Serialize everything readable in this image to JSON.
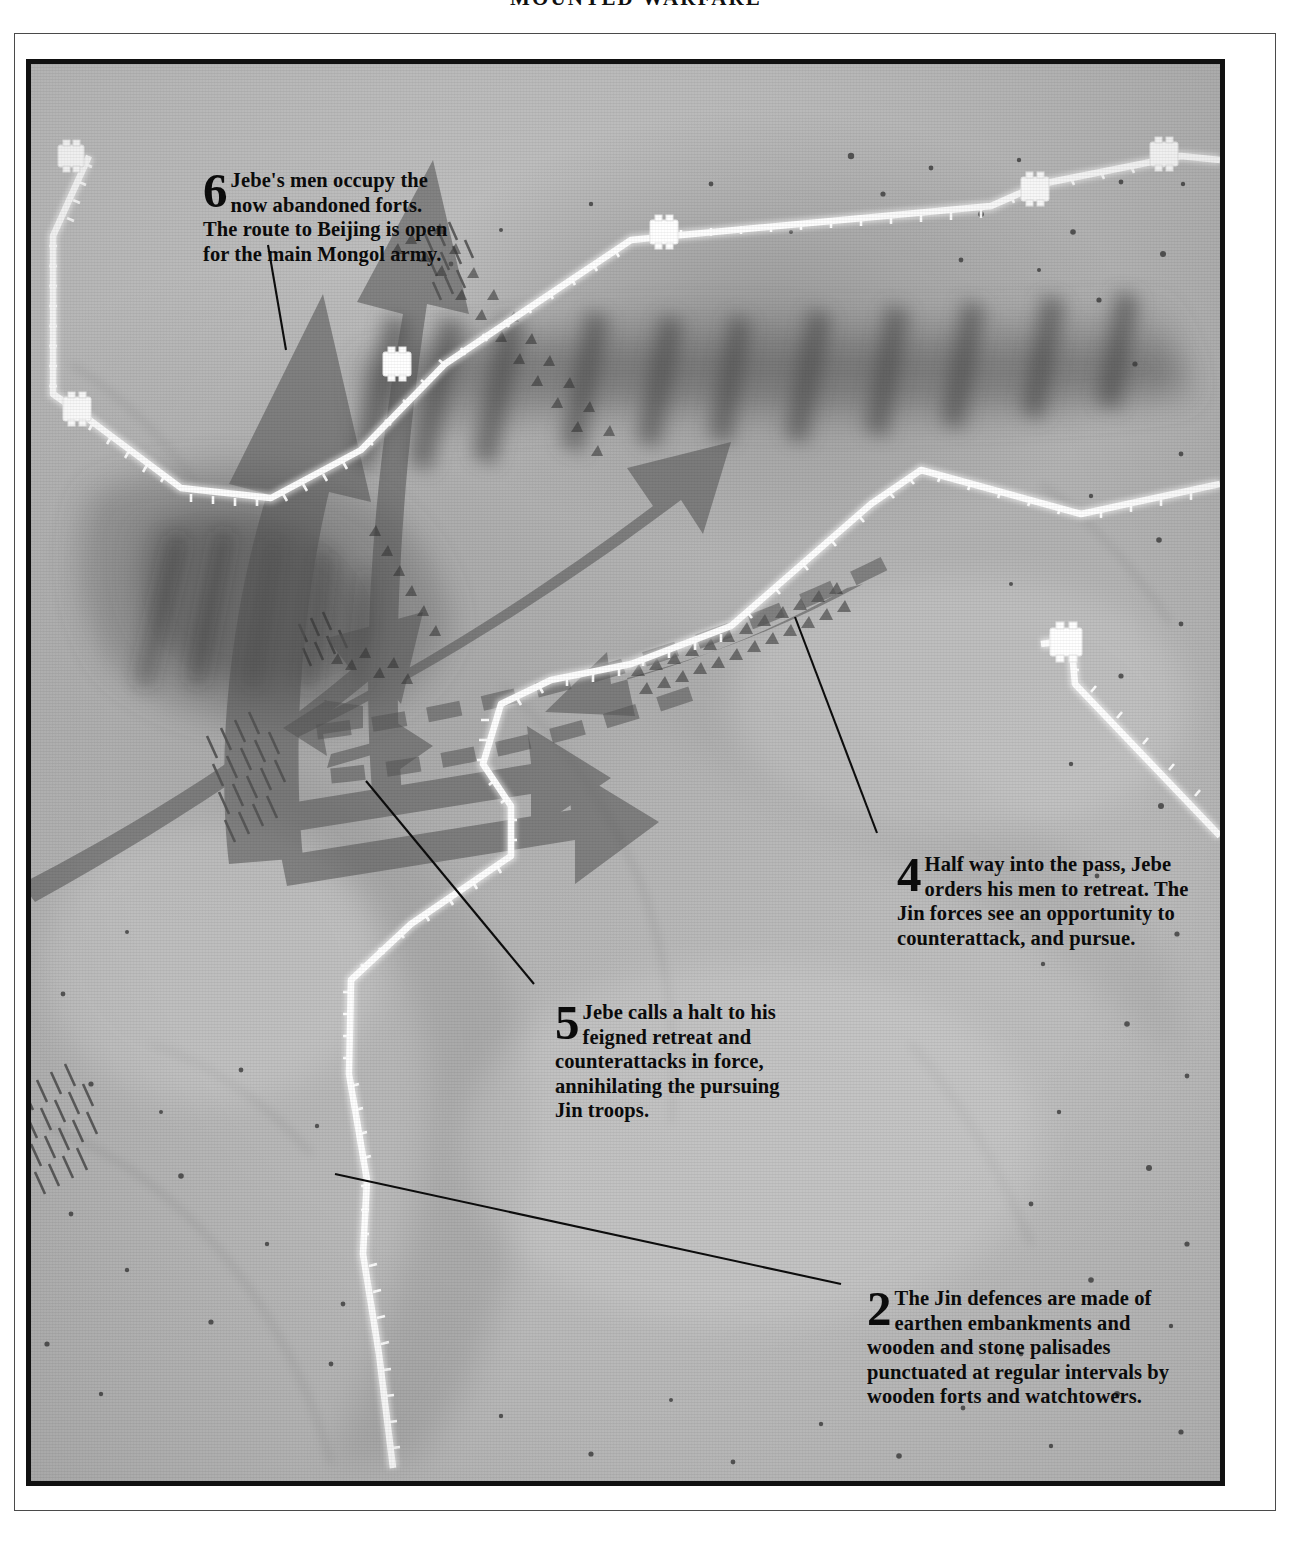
{
  "page": {
    "running_head": "MOUNTED WARFARE"
  },
  "map": {
    "title_visible": false,
    "base_color": "#b4b4b4",
    "frame_color": "#111111",
    "arrow_color": "#5f5f5f",
    "wall_color": "#ffffff",
    "callouts": [
      {
        "id": "callout-6",
        "number": "6",
        "text": "Jebe's men occupy the now abandoned forts. The route to Beijing is open for the main Mongol army.",
        "leader_from": [
          263,
          240
        ],
        "leader_to": [
          281,
          345
        ]
      },
      {
        "id": "callout-4",
        "number": "4",
        "text": "Half way into the pass, Jebe orders his men to retreat. The Jin forces see an opportunity to counterattack, and pursue.",
        "leader_from": [
          872,
          828
        ],
        "leader_to": [
          790,
          612
        ]
      },
      {
        "id": "callout-5",
        "number": "5",
        "text": "Jebe calls a halt to his feigned retreat and counterattacks in force, annihilating the pursuing Jin troops.",
        "leader_from": [
          529,
          979
        ],
        "leader_to": [
          361,
          776
        ]
      },
      {
        "id": "callout-2",
        "number": "2",
        "text": "The Jin defences are made of earthen embankments and wooden and stone palisades punctuated at regular intervals by wooden forts and watchtowers.",
        "leader_from": [
          836,
          1279
        ],
        "leader_to": [
          330,
          1169
        ]
      }
    ],
    "legend_items": [
      {
        "name": "jin-defensive-wall",
        "label": "Jin defensive wall / palisade"
      },
      {
        "name": "wooden-fort",
        "label": "Wooden fort or watchtower"
      },
      {
        "name": "mongol-advance-arrow",
        "label": "Mongol advance"
      },
      {
        "name": "feigned-retreat-arrow",
        "label": "Feigned retreat (dashed)"
      }
    ]
  }
}
